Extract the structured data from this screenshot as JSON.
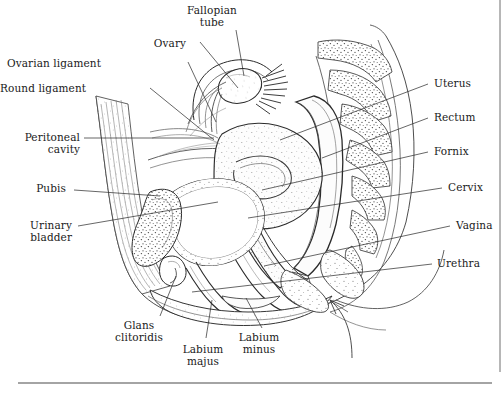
{
  "figure": {
    "ink_color": "#2b2b2b",
    "background_color": "#ffffff",
    "width": 503,
    "height": 397
  },
  "labels": {
    "fallopian_tube": "Fallopian\ntube",
    "ovary": "Ovary",
    "ovarian_ligament": "Ovarian ligament",
    "round_ligament": "Round ligament",
    "peritoneal_cavity": "Peritoneal\ncavity",
    "pubis": "Pubis",
    "urinary_bladder": "Urinary\nbladder",
    "glans_clitoridis": "Glans\nclitoridis",
    "labium_majus": "Labium\nmajus",
    "labium_minus": "Labium\nminus",
    "uterus": "Uterus",
    "rectum": "Rectum",
    "fornix": "Fornix",
    "cervix": "Cervix",
    "vagina": "Vagina",
    "urethra": "Urethra"
  },
  "label_positions": {
    "fallopian_tube": {
      "x": 212,
      "y": 10,
      "align": "ctr"
    },
    "ovary": {
      "x": 170,
      "y": 38,
      "align": "ctr"
    },
    "ovarian_ligament": {
      "x": 101,
      "y": 58,
      "align": "left"
    },
    "round_ligament": {
      "x": 64,
      "y": 82,
      "align": "left"
    },
    "peritoneal_cavity": {
      "x": 20,
      "y": 138,
      "align": "left"
    },
    "pubis": {
      "x": 46,
      "y": 189,
      "align": "left"
    },
    "urinary_bladder": {
      "x": 22,
      "y": 226,
      "align": "left"
    },
    "glans_clitoridis": {
      "x": 138,
      "y": 322,
      "align": "ctr"
    },
    "labium_majus": {
      "x": 201,
      "y": 345,
      "align": "ctr"
    },
    "labium_minus": {
      "x": 256,
      "y": 333,
      "align": "ctr"
    },
    "uterus": {
      "x": 434,
      "y": 78,
      "align": "right"
    },
    "rectum": {
      "x": 434,
      "y": 112,
      "align": "right"
    },
    "fornix": {
      "x": 434,
      "y": 146,
      "align": "right"
    },
    "cervix": {
      "x": 448,
      "y": 182,
      "align": "right"
    },
    "vagina": {
      "x": 456,
      "y": 220,
      "align": "right"
    },
    "urethra": {
      "x": 437,
      "y": 258,
      "align": "right"
    }
  }
}
